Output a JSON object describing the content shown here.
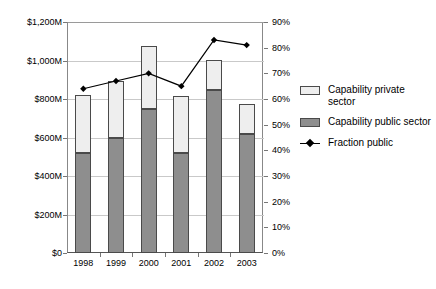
{
  "chart_data": {
    "type": "bar",
    "title": "",
    "subtitle": "",
    "xlabel": "",
    "ylabel": "",
    "y2label": "",
    "categories": [
      "1998",
      "1999",
      "2000",
      "2001",
      "2002",
      "2003"
    ],
    "series": [
      {
        "name": "Capability public sector",
        "axis": "left",
        "stacked": true,
        "color": "#8e8e8e",
        "values": [
          520,
          600,
          750,
          520,
          845,
          620
        ]
      },
      {
        "name": "Capability private sector",
        "axis": "left",
        "stacked": true,
        "color": "#eeeeee",
        "values": [
          300,
          295,
          325,
          295,
          160,
          155
        ]
      },
      {
        "name": "Fraction public",
        "axis": "right",
        "type": "line",
        "color": "#000000",
        "values": [
          64,
          67,
          70,
          65,
          83,
          81
        ]
      }
    ],
    "totals": [
      820,
      895,
      1075,
      815,
      1005,
      775
    ],
    "ylim": [
      0,
      1200
    ],
    "y2lim": [
      0,
      90
    ],
    "yticks": [
      0,
      200,
      400,
      600,
      800,
      1000,
      1200
    ],
    "yticklabels": [
      "$0",
      "$200M",
      "$400M",
      "$600M",
      "$800M",
      "$1,000M",
      "$1,200M"
    ],
    "y2ticks": [
      0,
      10,
      20,
      30,
      40,
      50,
      60,
      70,
      80,
      90
    ],
    "y2ticklabels": [
      "0%",
      "10%",
      "20%",
      "30%",
      "40%",
      "50%",
      "60%",
      "70%",
      "80%",
      "90%"
    ],
    "grid": true,
    "legend_position": "right",
    "legend": [
      "Capability private sector",
      "Capability public sector",
      "Fraction public"
    ]
  },
  "legend": {
    "items": [
      {
        "label": "Capability private sector",
        "swatch": "private-sector-swatch"
      },
      {
        "label": "Capability public sector",
        "swatch": "public-sector-swatch"
      },
      {
        "label": "Fraction public",
        "swatch": "fraction-public-line-swatch"
      }
    ]
  }
}
